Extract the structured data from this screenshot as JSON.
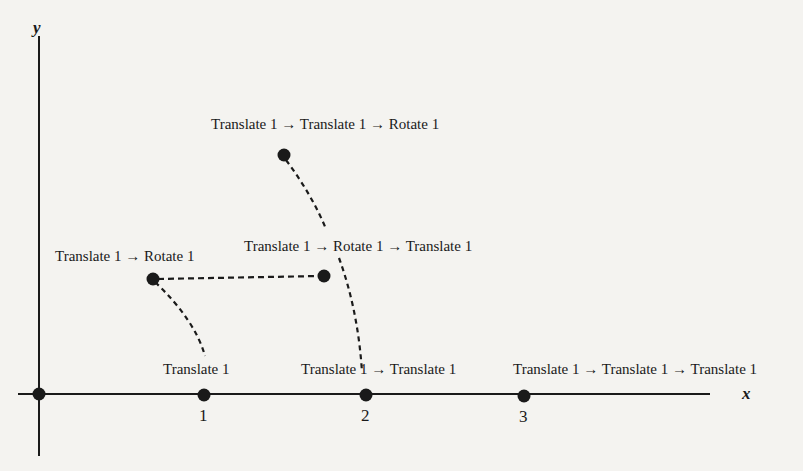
{
  "axes": {
    "x_label": "x",
    "y_label": "y",
    "ticks": [
      "1",
      "2",
      "3"
    ]
  },
  "labels": {
    "t1": "Translate 1",
    "t1_t1": "Translate 1 → Translate 1",
    "t1_t1_t1": "Translate 1 → Translate 1 → Translate 1",
    "t1_r1": "Translate 1 → Rotate 1",
    "t1_r1_t1": "Translate 1 → Rotate 1 → Translate 1",
    "t1_t1_r1": "Translate 1 → Translate 1 → Rotate 1"
  },
  "colors": {
    "ink": "#1a1a1a",
    "background": "#f4f3f0"
  }
}
